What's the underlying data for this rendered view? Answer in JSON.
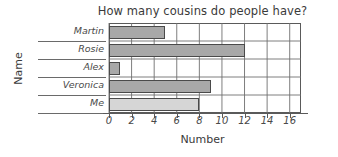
{
  "chart_data": {
    "type": "bar",
    "orientation": "horizontal",
    "title": "How many cousins do people have?",
    "xlabel": "Number",
    "ylabel": "Name",
    "categories": [
      "Martin",
      "Rosie",
      "Alex",
      "Veronica",
      "Me"
    ],
    "values": [
      5,
      12,
      1,
      9,
      8
    ],
    "xlim": [
      0,
      17
    ],
    "xticks": [
      0,
      2,
      4,
      6,
      8,
      10,
      12,
      14,
      16
    ],
    "xtick_labels": [
      "0",
      "2",
      "4",
      "6",
      "8",
      "10",
      "12",
      "14",
      "16"
    ],
    "grid": true,
    "legend": null,
    "bar_colors": [
      "#a8a8a8",
      "#a8a8a8",
      "#a8a8a8",
      "#a8a8a8",
      "#d6d6d6"
    ],
    "bar_border_color": "#4a4a4a",
    "axis_color": "#5a5a5a",
    "text_color": "#3a3a3a"
  }
}
